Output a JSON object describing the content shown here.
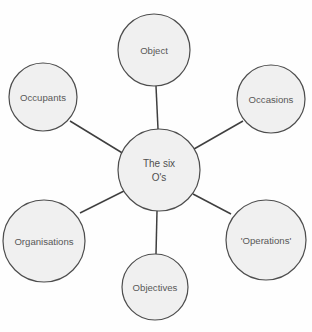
{
  "diagram": {
    "type": "hub-and-spoke-concept-map",
    "title_node": {
      "name": "center-node",
      "lines": [
        "The six",
        "O's"
      ],
      "cx": 159,
      "cy": 170,
      "r": 41
    },
    "colors": {
      "node_fill": "#f0f0f0",
      "node_stroke": "#4d4d4d",
      "connector": "#3f3f3f",
      "label_text": "#585858",
      "background": "#fefefe"
    },
    "nodes": [
      {
        "id": "object",
        "label": "Object",
        "cx": 154,
        "cy": 50,
        "r": 36
      },
      {
        "id": "occasions",
        "label": "Occasions",
        "cx": 271,
        "cy": 99,
        "r": 34
      },
      {
        "id": "operations",
        "label": "'Operations'",
        "cx": 266,
        "cy": 240,
        "r": 40
      },
      {
        "id": "objectives",
        "label": "Objectives",
        "cx": 155,
        "cy": 287,
        "r": 33
      },
      {
        "id": "organisations",
        "label": "Organisations",
        "cx": 44,
        "cy": 241,
        "r": 41
      },
      {
        "id": "occupants",
        "label": "Occupants",
        "cx": 43,
        "cy": 97,
        "r": 34
      }
    ],
    "connectors": [
      {
        "id": "center-to-object",
        "from": "center",
        "to": "object",
        "x1": 158,
        "y1": 129,
        "x2": 156,
        "y2": 86
      },
      {
        "id": "center-to-occasions",
        "from": "center",
        "to": "occasions",
        "x1": 194,
        "y1": 149,
        "x2": 243,
        "y2": 121
      },
      {
        "id": "center-to-operations",
        "from": "center",
        "to": "operations",
        "x1": 193,
        "y1": 194,
        "x2": 231,
        "y2": 214
      },
      {
        "id": "center-to-objectives",
        "from": "center",
        "to": "objectives",
        "x1": 157,
        "y1": 211,
        "x2": 156,
        "y2": 254
      },
      {
        "id": "center-to-organisations",
        "from": "center",
        "to": "organisations",
        "x1": 124,
        "y1": 191,
        "x2": 80,
        "y2": 213
      },
      {
        "id": "center-to-occupants",
        "from": "center",
        "to": "occupants",
        "x1": 124,
        "y1": 154,
        "x2": 70,
        "y2": 121
      }
    ]
  },
  "caption": {
    "cropped_text": ""
  }
}
